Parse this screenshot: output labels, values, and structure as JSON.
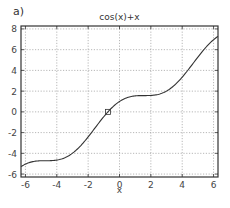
{
  "panel_label": "a)",
  "chart_data": {
    "type": "line",
    "title": "cos(x)+x",
    "xlabel": "x",
    "ylabel": "",
    "function": "cos(x)+x",
    "xlim": [
      -6.2832,
      6.2832
    ],
    "ylim": [
      -6.2832,
      8.2832
    ],
    "xticks": [
      -6,
      -4,
      -2,
      0,
      2,
      4,
      6
    ],
    "yticks": [
      -6,
      -4,
      -2,
      0,
      2,
      4,
      6,
      8
    ],
    "grid": true,
    "grid_style": "dotted",
    "series": [
      {
        "name": "cos(x)+x",
        "color": "#333333",
        "x": [
          -6.2832,
          -5.5,
          -5.0,
          -4.5,
          -4.0,
          -3.5,
          -3.0,
          -2.5,
          -2.0,
          -1.5,
          -1.0,
          -0.5,
          0.0,
          0.5,
          1.0,
          1.5,
          2.0,
          2.5,
          3.0,
          3.5,
          4.0,
          4.5,
          5.0,
          5.5,
          6.2832
        ],
        "values": [
          -5.283,
          -4.791,
          -4.716,
          -4.711,
          -4.654,
          -4.436,
          -3.99,
          -3.301,
          -2.416,
          -1.429,
          -0.46,
          0.378,
          1.0,
          1.378,
          1.54,
          1.571,
          1.584,
          1.699,
          2.01,
          2.564,
          3.346,
          4.289,
          5.284,
          6.209,
          7.283
        ]
      }
    ],
    "annotations": [
      {
        "type": "marker",
        "shape": "square",
        "x": -0.739,
        "y": 0.0,
        "label": "root"
      }
    ]
  },
  "colors": {
    "line": "#333333",
    "axes": "#333333",
    "grid": "#999999",
    "background": "#ffffff"
  }
}
